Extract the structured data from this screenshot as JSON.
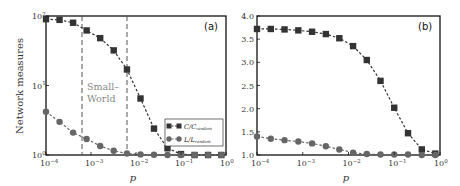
{
  "chart_data": [
    {
      "type": "line",
      "panel_label": "(a)",
      "xlabel": "p",
      "ylabel": "Network measures",
      "xscale": "log",
      "yscale": "log",
      "xlim": [
        0.0001,
        1
      ],
      "ylim": [
        1,
        100
      ],
      "x_ticks": [
        "10^-4",
        "10^-3",
        "10^-2",
        "10^-1",
        "10^0"
      ],
      "y_ticks": [
        "10^0",
        "10^1",
        "10^2"
      ],
      "grid": false,
      "legend_position": "lower right",
      "x": [
        0.0001,
        0.0002,
        0.0004,
        0.0008,
        0.0016,
        0.0032,
        0.0063,
        0.0126,
        0.0251,
        0.0501,
        0.1,
        0.2,
        0.4,
        0.79
      ],
      "series": [
        {
          "name": "C/C_random",
          "marker": "square",
          "color": "#333333",
          "values": [
            90,
            88,
            80,
            62,
            48,
            32,
            17,
            6.5,
            2.4,
            1.25,
            1.03,
            1.0,
            1.0,
            1.0
          ]
        },
        {
          "name": "L/L_random",
          "marker": "circle",
          "color": "#666666",
          "values": [
            4.2,
            3.0,
            2.1,
            1.7,
            1.35,
            1.15,
            1.05,
            1.02,
            1.01,
            1.0,
            1.0,
            1.0,
            1.0,
            1.0
          ]
        }
      ],
      "annotations": [
        {
          "text": "Small-World",
          "type": "region",
          "x_range": [
            0.00075,
            0.0065
          ]
        }
      ]
    },
    {
      "type": "line",
      "panel_label": "(b)",
      "xlabel": "p",
      "ylabel": "",
      "xscale": "log",
      "yscale": "linear",
      "xlim": [
        0.0001,
        1
      ],
      "ylim": [
        1.0,
        4.0
      ],
      "x_ticks": [
        "10^-4",
        "10^-3",
        "10^-2",
        "10^-1",
        "10^0"
      ],
      "y_ticks": [
        "1.0",
        "1.5",
        "2.0",
        "2.5",
        "3.0",
        "3.5",
        "4.0"
      ],
      "grid": false,
      "x": [
        0.0001,
        0.0002,
        0.0004,
        0.0008,
        0.0016,
        0.0032,
        0.0063,
        0.0126,
        0.0251,
        0.0501,
        0.1,
        0.2,
        0.4,
        0.79
      ],
      "series": [
        {
          "name": "C/C_random",
          "marker": "square",
          "color": "#333333",
          "values": [
            3.72,
            3.72,
            3.71,
            3.69,
            3.66,
            3.61,
            3.52,
            3.35,
            3.05,
            2.6,
            2.02,
            1.47,
            1.12,
            1.03
          ]
        },
        {
          "name": "L/L_random",
          "marker": "circle",
          "color": "#666666",
          "values": [
            1.4,
            1.35,
            1.32,
            1.29,
            1.25,
            1.19,
            1.12,
            1.05,
            1.02,
            1.01,
            1.01,
            1.01,
            1.0,
            1.0
          ]
        }
      ]
    }
  ],
  "labels": {
    "panel_a": "(a)",
    "panel_b": "(b)",
    "ylabel": "Network measures",
    "xlabel": "p",
    "small": "Small–",
    "world": "World",
    "legend_c_main": "C/C",
    "legend_c_sub": "random",
    "legend_l_main": "L/L",
    "legend_l_sub": "random",
    "tick_base": "10",
    "xtick_exps": [
      "−4",
      "−3",
      "−2",
      "−1",
      "0"
    ],
    "ytick_a_exps": [
      "0",
      "1",
      "2"
    ],
    "ytick_b": [
      "1.0",
      "1.5",
      "2.0",
      "2.5",
      "3.0",
      "3.5",
      "4.0"
    ]
  }
}
